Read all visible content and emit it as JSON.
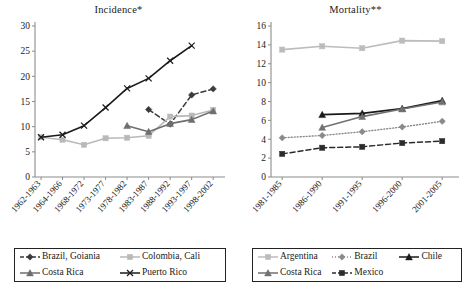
{
  "figure": {
    "width": 474,
    "height": 289,
    "background": "#ffffff"
  },
  "chart_data": [
    {
      "id": "incidence",
      "type": "line",
      "title": "Incidence*",
      "xlabel": "",
      "ylabel": "",
      "ylim": [
        0,
        30
      ],
      "yticks": [
        0,
        5,
        10,
        15,
        20,
        25,
        30
      ],
      "grid": false,
      "legend_position": "below",
      "categories": [
        "1962-1963",
        "1964-1966",
        "1968-1972",
        "1973-1977",
        "1978-1982",
        "1983-1987",
        "1988-1992",
        "1993-1997",
        "1998-2002"
      ],
      "series": [
        {
          "name": "Brazil, Goiania",
          "color": "#3b3b3b",
          "marker": "diamond",
          "dash": "5,3",
          "width": 1.5,
          "values": [
            null,
            null,
            null,
            null,
            null,
            13.4,
            10.5,
            16.3,
            17.5
          ]
        },
        {
          "name": "Colombia, Cali",
          "color": "#b9b9b9",
          "marker": "square",
          "dash": "none",
          "width": 1.6,
          "values": [
            7.9,
            7.4,
            6.4,
            7.7,
            7.8,
            8.2,
            12.0,
            12.2,
            13.3
          ]
        },
        {
          "name": "Costa Rica",
          "color": "#6e6e6e",
          "marker": "triangle",
          "dash": "none",
          "width": 1.6,
          "values": [
            null,
            null,
            null,
            null,
            10.2,
            9.0,
            10.6,
            11.4,
            13.1
          ]
        },
        {
          "name": "Puerto Rico",
          "color": "#1a1a1a",
          "marker": "cross",
          "dash": "none",
          "width": 1.6,
          "values": [
            7.9,
            8.4,
            10.2,
            13.8,
            17.6,
            19.6,
            23.1,
            26.1,
            null
          ]
        }
      ]
    },
    {
      "id": "mortality",
      "type": "line",
      "title": "Mortality**",
      "xlabel": "",
      "ylabel": "",
      "ylim": [
        0,
        16
      ],
      "yticks": [
        0,
        2,
        4,
        6,
        8,
        10,
        12,
        14,
        16
      ],
      "grid": false,
      "legend_position": "below",
      "categories": [
        "1981-1985",
        "1986-1990",
        "1991-1995",
        "1996-2000",
        "2001-2005"
      ],
      "series": [
        {
          "name": "Argentina",
          "color": "#bcbcbc",
          "marker": "square",
          "dash": "none",
          "width": 1.6,
          "values": [
            13.5,
            13.85,
            13.65,
            14.45,
            14.4
          ]
        },
        {
          "name": "Brazil",
          "color": "#8a8a8a",
          "marker": "diamond",
          "dash": "1,2",
          "width": 1.4,
          "values": [
            4.15,
            4.4,
            4.8,
            5.3,
            5.9
          ]
        },
        {
          "name": "Chile",
          "color": "#1a1a1a",
          "marker": "triangle",
          "dash": "none",
          "width": 1.8,
          "values": [
            null,
            6.6,
            6.75,
            7.25,
            8.1
          ]
        },
        {
          "name": "Costa Rica",
          "color": "#717171",
          "marker": "triangle",
          "dash": "none",
          "width": 1.6,
          "values": [
            null,
            5.25,
            6.4,
            7.2,
            7.95
          ]
        },
        {
          "name": "Mexico",
          "color": "#2b2b2b",
          "marker": "square",
          "dash": "5,3",
          "width": 1.5,
          "values": [
            2.45,
            3.1,
            3.2,
            3.6,
            3.8
          ]
        }
      ]
    }
  ],
  "legends": {
    "incidence": {
      "items": [
        {
          "label": "Brazil, Goiania",
          "color": "#3b3b3b",
          "marker": "diamond",
          "dash": "4,2"
        },
        {
          "label": "Colombia, Cali",
          "color": "#b9b9b9",
          "marker": "square",
          "dash": "none"
        },
        {
          "label": "Costa Rica",
          "color": "#6e6e6e",
          "marker": "triangle",
          "dash": "none"
        },
        {
          "label": "Puerto Rico",
          "color": "#1a1a1a",
          "marker": "cross",
          "dash": "none"
        }
      ]
    },
    "mortality": {
      "items": [
        {
          "label": "Argentina",
          "color": "#bcbcbc",
          "marker": "square",
          "dash": "none"
        },
        {
          "label": "Brazil",
          "color": "#8a8a8a",
          "marker": "diamond",
          "dash": "1,2"
        },
        {
          "label": "Chile",
          "color": "#1a1a1a",
          "marker": "triangle",
          "dash": "none"
        },
        {
          "label": "Costa Rica",
          "color": "#717171",
          "marker": "triangle",
          "dash": "none"
        },
        {
          "label": "Mexico",
          "color": "#2b2b2b",
          "marker": "square",
          "dash": "4,2"
        }
      ]
    }
  }
}
